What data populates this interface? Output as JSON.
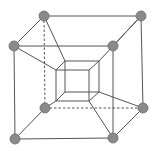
{
  "diagram": {
    "title": "Tesseract (hypercube) projection",
    "colors": {
      "edge": "#555555",
      "vertex_fill": "#8a8a8a",
      "vertex_stroke": "#6a6a6a",
      "background": "#ffffff"
    },
    "vertex_radius": 5,
    "outer_vertices": [
      {
        "id": "o_tbl",
        "x": 44,
        "y": 16
      },
      {
        "id": "o_tbr",
        "x": 141,
        "y": 16
      },
      {
        "id": "o_tfl",
        "x": 14,
        "y": 46
      },
      {
        "id": "o_tfr",
        "x": 113,
        "y": 46
      },
      {
        "id": "o_bbl",
        "x": 45,
        "y": 108
      },
      {
        "id": "o_bbr",
        "x": 143,
        "y": 108
      },
      {
        "id": "o_bfl",
        "x": 15,
        "y": 139
      },
      {
        "id": "o_bfr",
        "x": 113,
        "y": 138
      }
    ],
    "inner_vertices": [
      {
        "id": "i_tbl",
        "x": 65,
        "y": 61
      },
      {
        "id": "i_tbr",
        "x": 99,
        "y": 61
      },
      {
        "id": "i_tfl",
        "x": 56,
        "y": 70
      },
      {
        "id": "i_tfr",
        "x": 89,
        "y": 70
      },
      {
        "id": "i_bbl",
        "x": 65,
        "y": 92
      },
      {
        "id": "i_bbr",
        "x": 99,
        "y": 92
      },
      {
        "id": "i_bfl",
        "x": 56,
        "y": 101
      },
      {
        "id": "i_bfr",
        "x": 89,
        "y": 101
      }
    ],
    "edges": [
      [
        "o_tbl",
        "o_tbr",
        false
      ],
      [
        "o_tfl",
        "o_tfr",
        false
      ],
      [
        "o_bfl",
        "o_bfr",
        false
      ],
      [
        "o_bbl",
        "o_bbr",
        true
      ],
      [
        "o_tfl",
        "o_bfl",
        false
      ],
      [
        "o_tfr",
        "o_bfr",
        false
      ],
      [
        "o_tbr",
        "o_bbr",
        false
      ],
      [
        "o_tbl",
        "o_bbl",
        true
      ],
      [
        "o_tbl",
        "o_tfl",
        false
      ],
      [
        "o_tbr",
        "o_tfr",
        false
      ],
      [
        "o_bbr",
        "o_bfr",
        false
      ],
      [
        "o_bbl",
        "o_bfl",
        false
      ],
      [
        "i_tbl",
        "i_tbr",
        false
      ],
      [
        "i_bbl",
        "i_bbr",
        false
      ],
      [
        "i_tbl",
        "i_bbl",
        false
      ],
      [
        "i_tbr",
        "i_bbr",
        false
      ],
      [
        "i_tfl",
        "i_tfr",
        false
      ],
      [
        "i_bfl",
        "i_bfr",
        false
      ],
      [
        "i_tfl",
        "i_bfl",
        false
      ],
      [
        "i_tfr",
        "i_bfr",
        false
      ],
      [
        "i_tbl",
        "i_tfl",
        false
      ],
      [
        "i_tbr",
        "i_tfr",
        false
      ],
      [
        "i_bbl",
        "i_bfl",
        false
      ],
      [
        "i_bbr",
        "i_bfr",
        false
      ],
      [
        "o_tbl",
        "i_tbl",
        false
      ],
      [
        "o_tfl",
        "i_tfl",
        false
      ],
      [
        "o_tfr",
        "i_tbr",
        false
      ],
      [
        "o_tbr",
        "o_tfr",
        false
      ],
      [
        "o_bbr",
        "i_bbr",
        false
      ],
      [
        "o_bfr",
        "i_bfr",
        false
      ],
      [
        "o_bbl",
        "i_bfl",
        false
      ]
    ]
  }
}
